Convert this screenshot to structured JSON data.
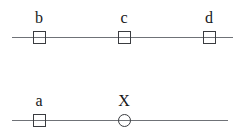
{
  "canvas": {
    "width": 243,
    "height": 133,
    "background": "#ffffff",
    "line_color": "#6f7277",
    "marker_color": "#3a3c40",
    "label_color": "#17181a"
  },
  "rows": [
    {
      "name": "top-line",
      "line": {
        "x1": 12,
        "x2": 233,
        "y": 37
      },
      "markers": [
        {
          "label": "b",
          "shape": "square",
          "cx": 39,
          "cy": 37,
          "size": 13,
          "label_x": 39,
          "label_y": 10
        },
        {
          "label": "c",
          "shape": "square",
          "cx": 124,
          "cy": 37,
          "size": 13,
          "label_x": 124,
          "label_y": 10
        },
        {
          "label": "d",
          "shape": "square",
          "cx": 209,
          "cy": 37,
          "size": 13,
          "label_x": 209,
          "label_y": 10
        }
      ]
    },
    {
      "name": "bottom-line",
      "line": {
        "x1": 12,
        "x2": 228,
        "y": 120
      },
      "markers": [
        {
          "label": "a",
          "shape": "square",
          "cx": 39,
          "cy": 120,
          "size": 13,
          "label_x": 39,
          "label_y": 93
        },
        {
          "label": "X",
          "shape": "circle",
          "cx": 124,
          "cy": 120,
          "size": 13,
          "label_x": 124,
          "label_y": 93
        }
      ]
    }
  ]
}
